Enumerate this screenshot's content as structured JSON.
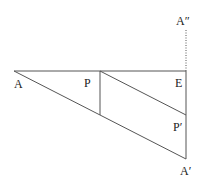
{
  "diagram": {
    "type": "geometry-construction",
    "points": {
      "A": {
        "label": "A",
        "x": 14,
        "y": 71
      },
      "P": {
        "label": "P",
        "x": 100,
        "y": 71
      },
      "E": {
        "label": "E",
        "x": 186,
        "y": 71
      },
      "A_double_prime": {
        "label": "A″",
        "x": 186,
        "y": 28
      },
      "P_foot": {
        "label": "",
        "x": 100,
        "y": 115
      },
      "P_prime": {
        "label": "P′",
        "x": 186,
        "y": 115
      },
      "A_prime": {
        "label": "A′",
        "x": 186,
        "y": 159
      }
    },
    "labels": {
      "A": "A",
      "P": "P",
      "E": "E",
      "A_double_prime": "A″",
      "P_prime": "P′",
      "A_prime": "A′"
    },
    "segments": [
      {
        "from": "A",
        "to": "E",
        "style": "solid"
      },
      {
        "from": "A",
        "to": "A_prime",
        "style": "solid"
      },
      {
        "from": "P",
        "to": "P_foot",
        "style": "solid"
      },
      {
        "from": "P",
        "to": "P_prime",
        "style": "solid"
      },
      {
        "from": "E",
        "to": "A_prime",
        "style": "solid"
      },
      {
        "from": "E",
        "to": "A_double_prime",
        "style": "dotted"
      }
    ],
    "colors": {
      "line": "#555555",
      "text": "#222222",
      "background": "#ffffff"
    }
  }
}
